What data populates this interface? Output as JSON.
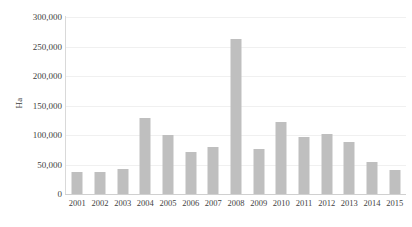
{
  "chart_data": {
    "type": "bar",
    "title": "",
    "subtitle": "",
    "xlabel": "",
    "ylabel": "Ha",
    "categories": [
      "2001",
      "2002",
      "2003",
      "2004",
      "2005",
      "2006",
      "2007",
      "2008",
      "2009",
      "2010",
      "2011",
      "2012",
      "2013",
      "2014",
      "2015"
    ],
    "values": [
      38000,
      38000,
      43000,
      129000,
      100000,
      71000,
      79000,
      263000,
      76000,
      122000,
      97000,
      101000,
      89000,
      55000,
      40000
    ],
    "series": [
      {
        "name": "Ha",
        "values": [
          38000,
          38000,
          43000,
          129000,
          100000,
          71000,
          79000,
          263000,
          76000,
          122000,
          97000,
          101000,
          89000,
          55000,
          40000
        ]
      }
    ],
    "ylim": [
      0,
      300000
    ],
    "xlim_categories": 15,
    "y_ticks": [
      0,
      50000,
      100000,
      150000,
      200000,
      250000,
      300000
    ],
    "y_tick_labels": [
      "0",
      "50,000",
      "100,000",
      "150,000",
      "200,000",
      "250,000",
      "300,000"
    ],
    "x_tick_labels": [
      "2001",
      "2002",
      "2003",
      "2004",
      "2005",
      "2006",
      "2007",
      "2008",
      "2009",
      "2010",
      "2011",
      "2012",
      "2013",
      "2014",
      "2015"
    ],
    "grid": true,
    "grid_axis": "y",
    "legend": false,
    "legend_position": "none",
    "bar_color": "#bfbfbf",
    "axis_color": "#d9d9d9",
    "grid_color": "#f0f0f0",
    "text_color": "#3f3f3f",
    "background": "#ffffff",
    "annotations": []
  }
}
